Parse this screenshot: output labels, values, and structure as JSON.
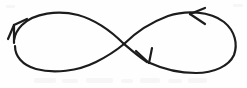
{
  "figure": {
    "title": "Infinity symbol with direction arrows",
    "description": "Hand-drawn lemniscate (figure-eight) curve crossing itself at the center, with three arrowheads marking the direction of travel.",
    "background_color": "#fefefe",
    "stroke_color": "#1c1c1c",
    "stroke_width": 2.2,
    "canvas": {
      "width": 247,
      "height": 88
    }
  },
  "chart_data": {
    "type": "line",
    "title": "Infinity symbol with direction arrows",
    "xlabel": "",
    "ylabel": "",
    "xlim": [
      0,
      247
    ],
    "ylim": [
      0,
      88
    ],
    "grid": false,
    "legend": "none",
    "series": [
      {
        "name": "lemniscate-path",
        "closed": true,
        "crossing_point": [
          124,
          44
        ],
        "left_lobe": {
          "extent_x": [
            14,
            124
          ],
          "extent_y": [
            13,
            72
          ],
          "apex_top": [
            66,
            14
          ],
          "apex_bottom": [
            72,
            71
          ],
          "leftmost": [
            15,
            44
          ]
        },
        "right_lobe": {
          "extent_x": [
            124,
            238
          ],
          "extent_y": [
            12,
            72
          ],
          "apex_top": [
            182,
            13
          ],
          "apex_bottom": [
            186,
            72
          ],
          "rightmost": [
            237,
            43
          ]
        }
      }
    ],
    "annotations": [
      {
        "name": "arrowhead-upper-left",
        "tip": [
          14,
          25
        ],
        "direction_degrees": 295,
        "meaning": "flow continues upward along left lobe"
      },
      {
        "name": "arrowhead-upper-right",
        "tip": [
          190,
          14
        ],
        "direction_degrees": 185,
        "meaning": "flow travels leftward across top of right lobe"
      },
      {
        "name": "arrowhead-center-descending",
        "tip": [
          149,
          63
        ],
        "direction_degrees": 35,
        "meaning": "flow descends to the right just past the crossing"
      }
    ]
  },
  "arrows": [
    {
      "id": "arrow-upper-left",
      "label": "up-left arrowhead"
    },
    {
      "id": "arrow-upper-right",
      "label": "left-pointing arrowhead"
    },
    {
      "id": "arrow-center",
      "label": "down-right arrowhead"
    }
  ]
}
